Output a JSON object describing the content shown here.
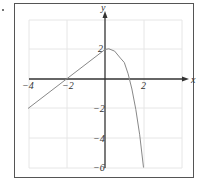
{
  "chart_data": {
    "type": "line",
    "title": "",
    "xlabel": "x",
    "ylabel": "y",
    "xlim": [
      -4,
      2.6
    ],
    "ylim": [
      -6,
      3.9
    ],
    "grid": true,
    "x_ticks": [
      -4,
      -2,
      2
    ],
    "y_ticks": [
      2,
      -2,
      -4,
      -6
    ],
    "x_tick_labels": [
      "−4",
      "−2",
      "2"
    ],
    "y_tick_labels": [
      "2",
      "−2",
      "−4",
      "−6"
    ],
    "series": [
      {
        "name": "linear piece (x ≤ 0)",
        "points": [
          [
            -4,
            -2
          ],
          [
            -2,
            0
          ],
          [
            0,
            2
          ]
        ]
      },
      {
        "name": "curved piece (x ≥ 0)",
        "points": [
          [
            0,
            2
          ],
          [
            0.2,
            2.05
          ],
          [
            0.5,
            1.89
          ],
          [
            0.8,
            1.42
          ],
          [
            1.0,
            1.12
          ],
          [
            1.2,
            0.35
          ],
          [
            1.4,
            -0.68
          ],
          [
            1.6,
            -2.06
          ],
          [
            1.8,
            -3.78
          ],
          [
            2.0,
            -6
          ]
        ]
      }
    ],
    "colors": {
      "axis": "#333333",
      "grid": "#e6e6e6",
      "curve": "#888888",
      "frame": "#555555"
    }
  }
}
